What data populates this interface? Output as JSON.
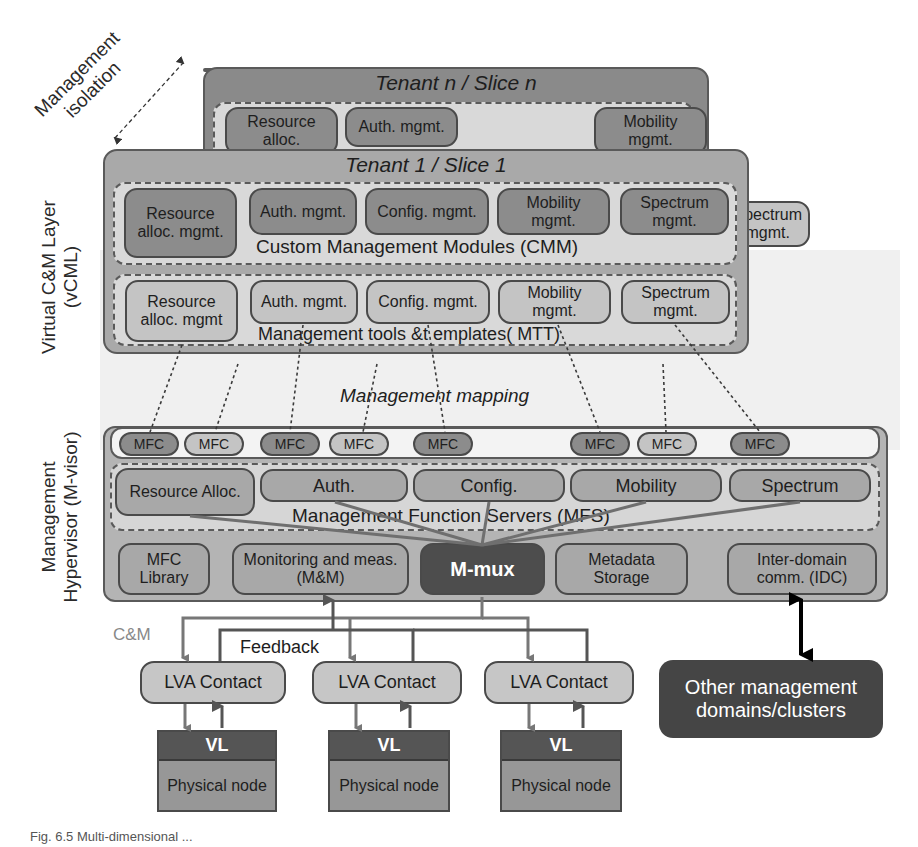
{
  "isolation": {
    "line1": "Management",
    "line2": "isolation"
  },
  "side_labels": {
    "vcml_line1": "Virtual C&M Layer",
    "vcml_line2": "(vCML)",
    "mvisor_line1": "Management",
    "mvisor_line2": "Hypervisor (M-visor)"
  },
  "tenant_n": {
    "title": "Tenant n / Slice n",
    "modules": [
      "Resource alloc.",
      "Auth. mgmt.",
      "Mobility mgmt."
    ],
    "mtt_modules": [
      "Spectrum mgmt."
    ]
  },
  "tenant_1": {
    "title": "Tenant 1 / Slice 1",
    "cmm": {
      "label": "Custom Management Modules (CMM)",
      "modules": [
        "Resource alloc. mgmt.",
        "Auth. mgmt.",
        "Config. mgmt.",
        "Mobility mgmt.",
        "Spectrum mgmt."
      ]
    },
    "mtt": {
      "label": "Management tools &t emplates( MTT)",
      "modules": [
        "Resource alloc. mgmt",
        "Auth. mgmt.",
        "Config. mgmt.",
        "Mobility mgmt.",
        "Spectrum mgmt."
      ]
    }
  },
  "mapping_label": "Management mapping",
  "mvisor": {
    "mfc_items": [
      "MFC",
      "MFC",
      "MFC",
      "MFC",
      "MFC",
      "MFC",
      "MFC",
      "MFC"
    ],
    "mfs": {
      "label": "Management Function Servers (MFS)",
      "servers": [
        "Resource Alloc.",
        "Auth.",
        "Config.",
        "Mobility",
        "Spectrum"
      ]
    },
    "bottom": {
      "mfc_library": "MFC Library",
      "monitoring": "Monitoring and meas. (M&M)",
      "mmux": "M-mux",
      "metadata": "Metadata Storage",
      "idc": "Inter-domain comm. (IDC)"
    }
  },
  "flow_labels": {
    "cm": "C&M",
    "feedback": "Feedback"
  },
  "nodes": [
    {
      "lva": "LVA Contact",
      "vl": "VL",
      "physical": "Physical node"
    },
    {
      "lva": "LVA Contact",
      "vl": "VL",
      "physical": "Physical node"
    },
    {
      "lva": "LVA Contact",
      "vl": "VL",
      "physical": "Physical node"
    }
  ],
  "other_domains": "Other management domains/clusters",
  "caption": "Fig. 6.5 Multi-dimensional ..."
}
